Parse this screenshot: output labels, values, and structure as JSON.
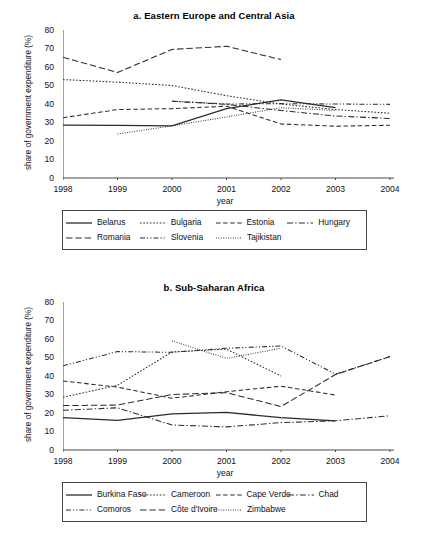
{
  "figure": {
    "y_axis_label": "share of government expenditure (%)",
    "x_axis_label": "year"
  },
  "chart_data": [
    {
      "type": "line",
      "panel": "a",
      "title": "a. Eastern Europe and Central Asia",
      "xlabel": "year",
      "ylabel": "share of government expenditure (%)",
      "x": [
        1998,
        1999,
        2000,
        2001,
        2002,
        2003,
        2004
      ],
      "xticks": [
        "1998",
        "1999",
        "2000",
        "2001",
        "2002",
        "2003",
        "2004"
      ],
      "yticks": [
        "0",
        "10",
        "20",
        "30",
        "40",
        "50",
        "60",
        "70",
        "80"
      ],
      "xlim": [
        1998,
        2004
      ],
      "ylim": [
        0,
        80
      ],
      "grid": false,
      "legend_position": "bottom",
      "series": [
        {
          "name": "Belarus",
          "style": "solid",
          "x": [
            1998,
            1999,
            2000,
            2001,
            2002,
            2003
          ],
          "values": [
            28.6,
            28.4,
            28.2,
            37.5,
            42.2,
            38.0
          ]
        },
        {
          "name": "Bulgaria",
          "style": "dotted",
          "x": [
            1998,
            1999,
            2000,
            2001,
            2002,
            2003,
            2004
          ],
          "values": [
            53.2,
            51.8,
            50.0,
            44.5,
            40.0,
            37.0,
            35.0
          ]
        },
        {
          "name": "Estonia",
          "style": "dashed",
          "x": [
            1998,
            1999,
            2000,
            2001,
            2002,
            2003,
            2004
          ],
          "values": [
            32.6,
            37.0,
            37.5,
            38.8,
            29.2,
            28.0,
            28.5
          ]
        },
        {
          "name": "Hungary",
          "style": "dashdot",
          "x": [
            2000,
            2001,
            2002,
            2003,
            2004
          ],
          "values": [
            41.5,
            39.8,
            36.5,
            33.5,
            32.2
          ]
        },
        {
          "name": "Romania",
          "style": "longdash",
          "x": [
            1998,
            1999,
            2000,
            2001,
            2002
          ],
          "values": [
            65.3,
            57.0,
            69.5,
            71.2,
            64.0
          ]
        },
        {
          "name": "Slovenia",
          "style": "dashdotdot",
          "x": [
            2000,
            2001,
            2002,
            2003,
            2004
          ],
          "values": [
            41.5,
            40.0,
            40.2,
            40.0,
            39.8
          ]
        },
        {
          "name": "Tajikistan",
          "style": "finedot",
          "x": [
            1999,
            2000,
            2001,
            2002,
            2003
          ],
          "values": [
            23.8,
            28.2,
            33.0,
            38.0,
            36.5
          ]
        }
      ]
    },
    {
      "type": "line",
      "panel": "b",
      "title": "b. Sub-Saharan Africa",
      "xlabel": "year",
      "ylabel": "share of government expenditure (%)",
      "x": [
        1998,
        1999,
        2000,
        2001,
        2002,
        2003,
        2004
      ],
      "xticks": [
        "1998",
        "1999",
        "2000",
        "2001",
        "2002",
        "2003",
        "2004"
      ],
      "yticks": [
        "0",
        "10",
        "20",
        "30",
        "40",
        "50",
        "60",
        "70",
        "80"
      ],
      "xlim": [
        1998,
        2004
      ],
      "ylim": [
        0,
        80
      ],
      "grid": false,
      "legend_position": "bottom",
      "series": [
        {
          "name": "Burkina Faso",
          "style": "solid",
          "x": [
            1998,
            1999,
            2000,
            2001,
            2002,
            2003
          ],
          "values": [
            17.5,
            16.0,
            19.5,
            20.3,
            17.5,
            15.8
          ]
        },
        {
          "name": "Cameroon",
          "style": "dotted",
          "x": [
            1998,
            1999,
            2000,
            2001,
            2002
          ],
          "values": [
            28.5,
            35.0,
            53.0,
            54.5,
            40.0
          ]
        },
        {
          "name": "Cape Verde",
          "style": "dashed",
          "x": [
            1998,
            1999,
            2000,
            2001,
            2002,
            2003
          ],
          "values": [
            37.3,
            34.0,
            28.0,
            31.5,
            34.5,
            29.7
          ]
        },
        {
          "name": "Chad",
          "style": "dashdot",
          "x": [
            1998,
            1999,
            2000,
            2001,
            2002,
            2003,
            2004
          ],
          "values": [
            21.5,
            22.8,
            13.5,
            12.5,
            14.8,
            15.8,
            18.5
          ]
        },
        {
          "name": "Comoros",
          "style": "dashdotdot",
          "x": [
            1998,
            1999,
            2000,
            2001,
            2002,
            2003,
            2004
          ],
          "values": [
            45.5,
            53.2,
            52.8,
            55.0,
            56.2,
            41.0,
            50.5
          ]
        },
        {
          "name": "Côte d'Ivoire",
          "style": "longdash",
          "x": [
            1998,
            1999,
            2000,
            2001,
            2002,
            2003,
            2004
          ],
          "values": [
            24.0,
            24.3,
            30.0,
            31.0,
            23.5,
            40.8,
            50.5
          ]
        },
        {
          "name": "Zimbabwe",
          "style": "finedot",
          "x": [
            2000,
            2001,
            2002
          ],
          "values": [
            59.0,
            49.5,
            55.0
          ]
        }
      ]
    }
  ],
  "panel_a": {
    "title": "a. Eastern Europe and Central Asia",
    "legend": {
      "row1": [
        {
          "label": "Belarus",
          "style": "solid"
        },
        {
          "label": "Bulgaria",
          "style": "dotted"
        },
        {
          "label": "Estonia",
          "style": "dashed"
        },
        {
          "label": "Hungary",
          "style": "dashdot"
        }
      ],
      "row2": [
        {
          "label": "Romania",
          "style": "longdash"
        },
        {
          "label": "Slovenia",
          "style": "dashdotdot"
        },
        {
          "label": "Tajikistan",
          "style": "finedot"
        }
      ]
    }
  },
  "panel_b": {
    "title": "b. Sub-Saharan Africa",
    "legend": {
      "row1": [
        {
          "label": "Burkina Faso",
          "style": "solid"
        },
        {
          "label": "Cameroon",
          "style": "dotted"
        },
        {
          "label": "Cape Verde",
          "style": "dashed"
        },
        {
          "label": "Chad",
          "style": "dashdot"
        }
      ],
      "row2": [
        {
          "label": "Comoros",
          "style": "dashdotdot"
        },
        {
          "label": "Côte d'Ivoire",
          "style": "longdash"
        },
        {
          "label": "Zimbabwe",
          "style": "finedot"
        }
      ]
    }
  }
}
